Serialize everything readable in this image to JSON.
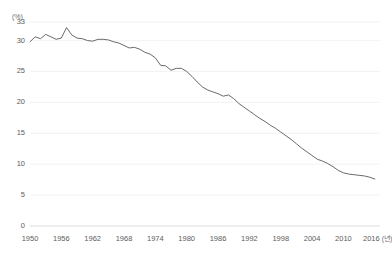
{
  "chart_data": {
    "type": "line",
    "title": "",
    "subtitle": "",
    "xlabel": "",
    "ylabel": "",
    "y_unit_label": "(%)",
    "x_unit_label": "(년)",
    "x_axis_last_tick_label": "2016 (년)",
    "grid": true,
    "legend": "none",
    "xlim": [
      1950,
      2017
    ],
    "ylim": [
      0,
      33
    ],
    "ytick_labels": [
      "33",
      "30",
      "25",
      "20",
      "15",
      "10",
      "5",
      "0"
    ],
    "ytick_values": [
      33,
      30,
      25,
      20,
      15,
      10,
      5,
      0
    ],
    "xtick_labels": [
      "1950",
      "1956",
      "1962",
      "1968",
      "1974",
      "1980",
      "1986",
      "1992",
      "1998",
      "2004",
      "2010",
      "2016"
    ],
    "xtick_values": [
      1950,
      1956,
      1962,
      1968,
      1974,
      1980,
      1986,
      1992,
      1998,
      2004,
      2010,
      2016
    ],
    "line_color": "#595959",
    "grid_color": "#f0f0f0",
    "axis_color": "#d8d8d8",
    "series": [
      {
        "name": "series-1",
        "x": [
          1950,
          1951,
          1952,
          1953,
          1954,
          1955,
          1956,
          1957,
          1958,
          1959,
          1960,
          1961,
          1962,
          1963,
          1964,
          1965,
          1966,
          1967,
          1968,
          1969,
          1970,
          1971,
          1972,
          1973,
          1974,
          1975,
          1976,
          1977,
          1978,
          1979,
          1980,
          1981,
          1982,
          1983,
          1984,
          1985,
          1986,
          1987,
          1988,
          1989,
          1990,
          1991,
          1992,
          1993,
          1994,
          1995,
          1996,
          1997,
          1998,
          1999,
          2000,
          2001,
          2002,
          2003,
          2004,
          2005,
          2006,
          2007,
          2008,
          2009,
          2010,
          2011,
          2012,
          2013,
          2014,
          2015,
          2016
        ],
        "values": [
          29.8,
          30.6,
          30.3,
          31.0,
          30.6,
          30.2,
          30.4,
          32.1,
          30.9,
          30.4,
          30.3,
          30.0,
          29.9,
          30.2,
          30.2,
          30.1,
          29.8,
          29.6,
          29.2,
          28.8,
          28.9,
          28.6,
          28.1,
          27.8,
          27.2,
          26.0,
          25.9,
          25.2,
          25.5,
          25.5,
          25.0,
          24.2,
          23.3,
          22.5,
          22.0,
          21.7,
          21.4,
          21.0,
          21.2,
          20.6,
          19.8,
          19.2,
          18.6,
          18.0,
          17.4,
          16.9,
          16.3,
          15.8,
          15.2,
          14.6,
          14.0,
          13.3,
          12.6,
          12.0,
          11.4,
          10.8,
          10.5,
          10.1,
          9.6,
          9.0,
          8.6,
          8.4,
          8.3,
          8.2,
          8.1,
          7.9,
          7.6
        ]
      }
    ]
  },
  "axes": {
    "y_unit": "(%)",
    "y_ticks": [
      "33",
      "30",
      "25",
      "20",
      "15",
      "10",
      "5",
      "0"
    ],
    "x_ticks": [
      "1950",
      "1956",
      "1962",
      "1968",
      "1974",
      "1980",
      "1986",
      "1992",
      "1998",
      "2004",
      "2010",
      "2016"
    ],
    "x_last_unit": "(년)"
  }
}
